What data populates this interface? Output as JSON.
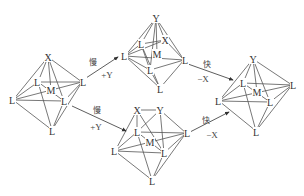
{
  "diagram": {
    "type": "reaction-mechanism",
    "reactant": {
      "atoms": [
        {
          "label": "X",
          "x": 48,
          "y": 57
        },
        {
          "label": "L",
          "x": 38,
          "y": 82
        },
        {
          "label": "L",
          "x": 82,
          "y": 82
        },
        {
          "label": "M",
          "x": 51,
          "y": 90
        },
        {
          "label": "L",
          "x": 13,
          "y": 100
        },
        {
          "label": "L",
          "x": 64,
          "y": 101
        },
        {
          "label": "L",
          "x": 52,
          "y": 130
        }
      ]
    },
    "intermediate_top": {
      "atoms": [
        {
          "label": "Y",
          "x": 156,
          "y": 18
        },
        {
          "label": "L",
          "x": 141,
          "y": 44
        },
        {
          "label": "X",
          "x": 165,
          "y": 40
        },
        {
          "label": "M",
          "x": 157,
          "y": 54
        },
        {
          "label": "L",
          "x": 125,
          "y": 56
        },
        {
          "label": "L",
          "x": 184,
          "y": 60
        },
        {
          "label": "L",
          "x": 150,
          "y": 70
        },
        {
          "label": "L",
          "x": 160,
          "y": 88
        }
      ]
    },
    "intermediate_bottom": {
      "atoms": [
        {
          "label": "X",
          "x": 137,
          "y": 110
        },
        {
          "label": "Y",
          "x": 160,
          "y": 110
        },
        {
          "label": "L",
          "x": 137,
          "y": 132
        },
        {
          "label": "M",
          "x": 150,
          "y": 142
        },
        {
          "label": "L",
          "x": 186,
          "y": 133
        },
        {
          "label": "L",
          "x": 115,
          "y": 151
        },
        {
          "label": "L",
          "x": 164,
          "y": 153
        },
        {
          "label": "L",
          "x": 152,
          "y": 180
        }
      ]
    },
    "product": {
      "atoms": [
        {
          "label": "Y",
          "x": 253,
          "y": 59
        },
        {
          "label": "L",
          "x": 243,
          "y": 83
        },
        {
          "label": "M",
          "x": 257,
          "y": 92
        },
        {
          "label": "L",
          "x": 292,
          "y": 85
        },
        {
          "label": "L",
          "x": 219,
          "y": 101
        },
        {
          "label": "L",
          "x": 270,
          "y": 102
        },
        {
          "label": "L",
          "x": 256,
          "y": 131
        }
      ]
    },
    "arrows": [
      {
        "id": "step1-top",
        "rate": "慢",
        "reagent": "+Y"
      },
      {
        "id": "step2-top",
        "rate": "快",
        "reagent": "−X"
      },
      {
        "id": "step1-bottom",
        "rate": "慢",
        "reagent": "+Y"
      },
      {
        "id": "step2-bottom",
        "rate": "快",
        "reagent": "−X"
      }
    ]
  }
}
